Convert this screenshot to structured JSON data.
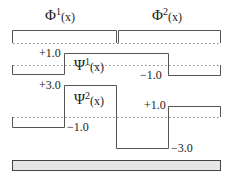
{
  "diagram": {
    "basis_functions": [
      {
        "name": "Φ",
        "index": "1",
        "arg": "(x)"
      },
      {
        "name": "Φ",
        "index": "2",
        "arg": "(x)"
      }
    ],
    "wavelets": [
      {
        "name": "Ψ",
        "index": "1",
        "arg": "(x)",
        "values": [
          "+1.0",
          "-1.0"
        ]
      },
      {
        "name": "Ψ",
        "index": "2",
        "arg": "(x)",
        "values": [
          "+3.0",
          "-1.0",
          "-3.0",
          "+1.0"
        ]
      }
    ],
    "labels": {
      "psi1_high": "+1.0",
      "psi1_low": "−1.0",
      "psi2_a": "+3.0",
      "psi2_b": "−1.0",
      "psi2_c": "−3.0",
      "psi2_d": "+1.0"
    },
    "colors": {
      "line": "#555555",
      "dotted": "#888888",
      "bar_fill": "#e6e6e6",
      "bar_stroke": "#444444"
    }
  }
}
